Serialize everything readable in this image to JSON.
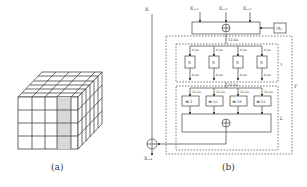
{
  "figure_a": {
    "caption": "(a)",
    "grid": {
      "cols": 4,
      "rows": 4,
      "depth": 6,
      "highlighted_column": 4,
      "highlight_color": "#d9d9d9"
    }
  },
  "figure_b": {
    "caption": "(b)",
    "inputs": {
      "xi": "X_i",
      "xi1": "X_{i+1}",
      "xi2": "X_{i+2}",
      "xi3": "X_{i+3}"
    },
    "round_key": "rk_i",
    "output": "X_{i+4}",
    "label_32bit": "32-bit",
    "label_8bit": "8-bit",
    "sbox_label": "S",
    "tau_label": "τ",
    "L_label": "L",
    "T_label": "T",
    "rotations": [
      "≪ 2",
      "≪ 10",
      "≪ 18",
      "≪ 24"
    ]
  }
}
